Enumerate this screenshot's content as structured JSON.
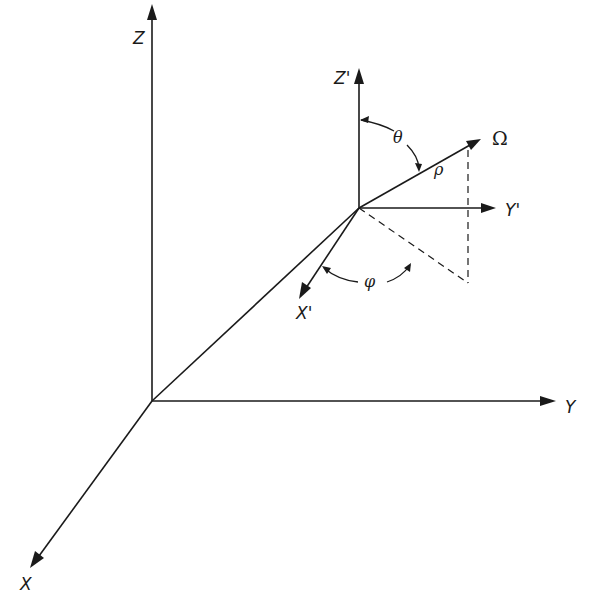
{
  "figure": {
    "type": "3d-coordinate-diagram"
  },
  "axes": {
    "global": {
      "x_label": "X",
      "y_label": "Y",
      "z_label": "Z"
    },
    "local": {
      "x_label": "X'",
      "y_label": "Y'",
      "z_label": "Z'"
    }
  },
  "vector": {
    "label": "Ω",
    "magnitude_label": "ρ"
  },
  "angles": {
    "polar": "θ",
    "azimuthal": "φ"
  },
  "colors": {
    "ink": "#1a1a1a",
    "background": "#ffffff"
  }
}
